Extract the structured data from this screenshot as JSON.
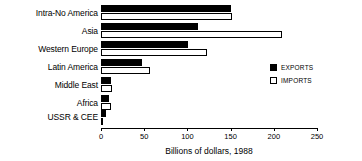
{
  "chart_data": {
    "type": "bar",
    "orientation": "horizontal",
    "title": "",
    "xlabel": "Billions of dollars, 1988",
    "ylabel": "",
    "xlim": [
      0,
      250
    ],
    "xticks": [
      0,
      50,
      100,
      150,
      200,
      250
    ],
    "xtick_labels": [
      "0",
      "50",
      "100",
      "150",
      "200",
      "250"
    ],
    "grid": false,
    "legend_position": "right",
    "categories": [
      "Intra-No America",
      "Asia",
      "Western Europe",
      "Latin America",
      "Middle East",
      "Africa",
      "USSR & CEE"
    ],
    "series": [
      {
        "name": "EXPORTS",
        "color": "#000000",
        "values": [
          151,
          112,
          101,
          48,
          12,
          9,
          6
        ]
      },
      {
        "name": "IMPORTS",
        "color": "#ffffff",
        "values": [
          152,
          209,
          123,
          57,
          13,
          12,
          2
        ]
      }
    ]
  },
  "legend": {
    "items": [
      {
        "label": "EXPORTS",
        "style": "filled"
      },
      {
        "label": "IMPORTS",
        "style": "hollow"
      }
    ]
  },
  "colors": {
    "exports": "#000000",
    "imports": "#ffffff",
    "axis": "#000000",
    "background": "#ffffff"
  }
}
